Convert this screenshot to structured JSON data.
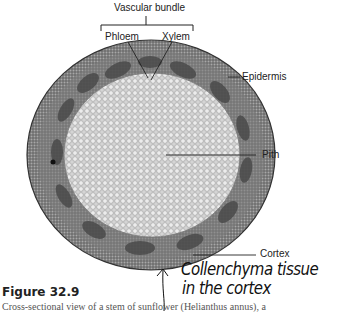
{
  "figure": {
    "number": "Figure 32.9",
    "caption": "Cross-sectional view of a stem of sunflower (Helianthus annus), a"
  },
  "labels": {
    "vascular_bundle": "Vascular bundle",
    "phloem": "Phloem",
    "xylem": "Xylem",
    "epidermis": "Epidermis",
    "pith": "Pith",
    "cortex": "Cortex"
  },
  "handwritten_note": {
    "line1": "Collenchyma tissue",
    "line2": "in the cortex"
  }
}
